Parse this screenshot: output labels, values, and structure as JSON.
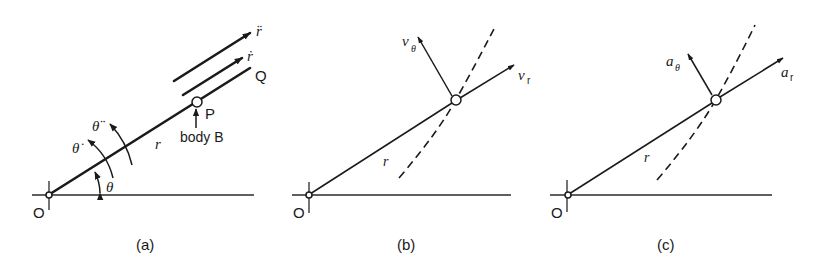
{
  "figure": {
    "panels": [
      {
        "id": "a",
        "caption": "(a)",
        "labels": {
          "origin": "O",
          "point_p": "P",
          "point_q": "Q",
          "body": "body B",
          "radius": "r",
          "r_dot": "ṙ",
          "r_ddot": "r̈",
          "theta": "θ",
          "theta_dot": "θ̇",
          "theta_ddot": "θ̈"
        }
      },
      {
        "id": "b",
        "caption": "(b)",
        "labels": {
          "origin": "O",
          "radius": "r",
          "v_r": "v",
          "v_r_sub": "r",
          "v_theta": "v",
          "v_theta_sub": "θ"
        }
      },
      {
        "id": "c",
        "caption": "(c)",
        "labels": {
          "origin": "O",
          "radius": "r",
          "a_r": "a",
          "a_r_sub": "r",
          "a_theta": "a",
          "a_theta_sub": "θ"
        }
      }
    ],
    "colors": {
      "ink": "#1a1a1a",
      "background": "#ffffff"
    }
  }
}
